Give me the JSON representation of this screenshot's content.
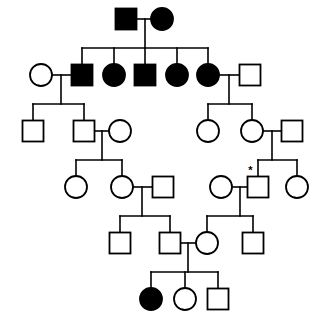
{
  "chart_data": {
    "type": "diagram",
    "diagram_kind": "pedigree",
    "symbol_legend": {
      "square": "male",
      "circle": "female",
      "filled": "affected",
      "open": "unaffected",
      "asterisk": "proband-or-index-marker"
    },
    "colors": {
      "background": "#ffffff",
      "line": "#000000",
      "affected_fill": "#000000",
      "unaffected_fill": "#ffffff"
    },
    "canvas": {
      "width": 321,
      "height": 325
    },
    "generation_rows": [
      19,
      75,
      131,
      187,
      243,
      299
    ],
    "counts": {
      "total_individuals": 31,
      "affected": 8,
      "affected_males": 3,
      "affected_females": 5,
      "generations": 6
    },
    "individuals": [
      {
        "id": "I-1",
        "sex": "male",
        "affected": true,
        "x": 126,
        "y": 19,
        "generation": 1
      },
      {
        "id": "I-2",
        "sex": "female",
        "affected": true,
        "x": 162,
        "y": 19,
        "generation": 1
      },
      {
        "id": "II-1",
        "sex": "female",
        "affected": false,
        "x": 41,
        "y": 75,
        "generation": 2
      },
      {
        "id": "II-2",
        "sex": "male",
        "affected": true,
        "x": 82,
        "y": 75,
        "generation": 2
      },
      {
        "id": "II-3",
        "sex": "female",
        "affected": true,
        "x": 114,
        "y": 75,
        "generation": 2
      },
      {
        "id": "II-4",
        "sex": "male",
        "affected": true,
        "x": 145,
        "y": 75,
        "generation": 2
      },
      {
        "id": "II-5",
        "sex": "female",
        "affected": true,
        "x": 177,
        "y": 75,
        "generation": 2
      },
      {
        "id": "II-6",
        "sex": "female",
        "affected": true,
        "x": 208,
        "y": 75,
        "generation": 2
      },
      {
        "id": "II-7",
        "sex": "male",
        "affected": false,
        "x": 250,
        "y": 75,
        "generation": 2
      },
      {
        "id": "III-1",
        "sex": "male",
        "affected": false,
        "x": 33,
        "y": 131,
        "generation": 3
      },
      {
        "id": "III-2",
        "sex": "male",
        "affected": false,
        "x": 84,
        "y": 131,
        "generation": 3
      },
      {
        "id": "III-3",
        "sex": "female",
        "affected": false,
        "x": 120,
        "y": 131,
        "generation": 3
      },
      {
        "id": "III-4",
        "sex": "female",
        "affected": false,
        "x": 208,
        "y": 131,
        "generation": 3
      },
      {
        "id": "III-5",
        "sex": "female",
        "affected": false,
        "x": 252,
        "y": 131,
        "generation": 3
      },
      {
        "id": "III-6",
        "sex": "male",
        "affected": false,
        "x": 292,
        "y": 131,
        "generation": 3
      },
      {
        "id": "IV-1",
        "sex": "female",
        "affected": false,
        "x": 76,
        "y": 187,
        "generation": 4
      },
      {
        "id": "IV-2",
        "sex": "female",
        "affected": false,
        "x": 122,
        "y": 187,
        "generation": 4
      },
      {
        "id": "IV-3",
        "sex": "male",
        "affected": false,
        "x": 163,
        "y": 187,
        "generation": 4
      },
      {
        "id": "IV-4",
        "sex": "female",
        "affected": false,
        "x": 221,
        "y": 187,
        "generation": 4
      },
      {
        "id": "IV-5",
        "sex": "male",
        "affected": false,
        "x": 258,
        "y": 187,
        "generation": 4,
        "marker": "*"
      },
      {
        "id": "IV-6",
        "sex": "female",
        "affected": false,
        "x": 297,
        "y": 187,
        "generation": 4
      },
      {
        "id": "V-1",
        "sex": "male",
        "affected": false,
        "x": 120,
        "y": 243,
        "generation": 5
      },
      {
        "id": "V-2",
        "sex": "male",
        "affected": false,
        "x": 170,
        "y": 243,
        "generation": 5
      },
      {
        "id": "V-3",
        "sex": "female",
        "affected": false,
        "x": 207,
        "y": 243,
        "generation": 5
      },
      {
        "id": "V-4",
        "sex": "male",
        "affected": false,
        "x": 253,
        "y": 243,
        "generation": 5
      },
      {
        "id": "VI-1",
        "sex": "female",
        "affected": true,
        "x": 151,
        "y": 299,
        "generation": 6
      },
      {
        "id": "VI-2",
        "sex": "female",
        "affected": false,
        "x": 185,
        "y": 299,
        "generation": 6
      },
      {
        "id": "VI-3",
        "sex": "male",
        "affected": false,
        "x": 218,
        "y": 299,
        "generation": 6
      }
    ],
    "matings": [
      {
        "id": "M1",
        "partners": [
          "I-1",
          "I-2"
        ],
        "drop_x": 145,
        "y": 19
      },
      {
        "id": "M2",
        "partners": [
          "II-1",
          "II-2"
        ],
        "drop_x": 61,
        "y": 75
      },
      {
        "id": "M3",
        "partners": [
          "II-6",
          "II-7"
        ],
        "drop_x": 229,
        "y": 75
      },
      {
        "id": "M4",
        "partners": [
          "III-2",
          "III-3"
        ],
        "drop_x": 102,
        "y": 131
      },
      {
        "id": "M5",
        "partners": [
          "III-5",
          "III-6"
        ],
        "drop_x": 272,
        "y": 131
      },
      {
        "id": "M6",
        "partners": [
          "IV-2",
          "IV-3"
        ],
        "drop_x": 142,
        "y": 187
      },
      {
        "id": "M7",
        "partners": [
          "IV-4",
          "IV-5"
        ],
        "drop_x": 240,
        "y": 187
      },
      {
        "id": "M8",
        "partners": [
          "V-2",
          "V-3"
        ],
        "drop_x": 188,
        "y": 243
      }
    ],
    "sibships": [
      {
        "id": "S1",
        "parents": "M1",
        "bar_y": 48,
        "children": [
          "II-2",
          "II-3",
          "II-4",
          "II-5",
          "II-6"
        ]
      },
      {
        "id": "S2",
        "parents": "M2",
        "bar_y": 104,
        "children": [
          "III-1",
          "III-2"
        ]
      },
      {
        "id": "S3",
        "parents": "M3",
        "bar_y": 104,
        "children": [
          "III-4",
          "III-5"
        ]
      },
      {
        "id": "S4",
        "parents": "M4",
        "bar_y": 160,
        "children": [
          "IV-1",
          "IV-2"
        ]
      },
      {
        "id": "S5",
        "parents": "M5",
        "bar_y": 160,
        "children": [
          "IV-5",
          "IV-6"
        ]
      },
      {
        "id": "S6",
        "parents": "M6",
        "bar_y": 216,
        "children": [
          "V-1",
          "V-2"
        ]
      },
      {
        "id": "S7",
        "parents": "M7",
        "bar_y": 216,
        "children": [
          "V-3",
          "V-4"
        ]
      },
      {
        "id": "S8",
        "parents": "M8",
        "bar_y": 272,
        "children": [
          "VI-1",
          "VI-2",
          "VI-3"
        ]
      }
    ],
    "geometry": {
      "square_size": 21,
      "circle_radius": 11,
      "mating_line_inset": 1
    }
  }
}
